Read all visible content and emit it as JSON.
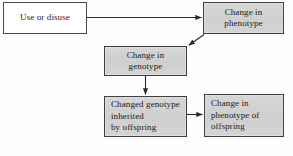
{
  "diagram": {
    "background_color": "#fdfdfd",
    "box_fill_white": "#ffffff",
    "box_fill_gray": "#d2d2d2",
    "box_border_color": "#4a4a4a",
    "arrow_color": "#2b2b2b",
    "nodes": [
      {
        "id": "use-or-disuse",
        "fill": "white",
        "align": "center",
        "lines": [
          "Use or disuse"
        ]
      },
      {
        "id": "change-phenotype",
        "fill": "gray",
        "align": "center",
        "lines": [
          "Change in",
          "phenotype"
        ]
      },
      {
        "id": "change-genotype",
        "fill": "gray",
        "align": "center",
        "lines": [
          "Change in",
          "genotype"
        ]
      },
      {
        "id": "changed-genotype-inherited",
        "fill": "gray",
        "align": "left",
        "lines": [
          "Changed genotype",
          "inherited",
          "by offspring"
        ]
      },
      {
        "id": "change-phenotype-offspring",
        "fill": "gray",
        "align": "left",
        "lines": [
          "Change in",
          "phenotype of",
          "offspring"
        ]
      }
    ],
    "connectors": [
      {
        "id": "use-to-phenotype",
        "from": "use-or-disuse",
        "to": "change-phenotype",
        "shape": "horizontal-right"
      },
      {
        "id": "phenotype-to-genotype",
        "from": "change-phenotype",
        "to": "change-genotype",
        "shape": "diagonal-down-left"
      },
      {
        "id": "genotype-to-inherited",
        "from": "change-genotype",
        "to": "changed-genotype-inherited",
        "shape": "vertical-down"
      },
      {
        "id": "inherited-to-offspring-phenotype",
        "from": "changed-genotype-inherited",
        "to": "change-phenotype-offspring",
        "shape": "horizontal-right"
      }
    ]
  }
}
